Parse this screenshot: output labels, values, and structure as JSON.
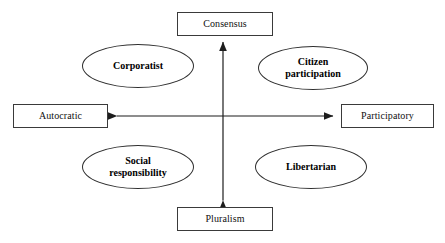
{
  "diagram": {
    "background_color": "#ffffff",
    "stroke_color": "#2f2f2f",
    "text_color": "#111111",
    "axes": {
      "vertical": {
        "top_label": "Consensus",
        "bottom_label": "Pluralism",
        "arrow_both_ends": true
      },
      "horizontal": {
        "left_label": "Autocratic",
        "right_label": "Participatory",
        "arrow_both_ends": true
      }
    },
    "boxes": [
      {
        "id": "consensus",
        "label": "Consensus",
        "position": "top"
      },
      {
        "id": "autocratic",
        "label": "Autocratic",
        "position": "left"
      },
      {
        "id": "participatory",
        "label": "Participatory",
        "position": "right"
      },
      {
        "id": "pluralism",
        "label": "Pluralism",
        "position": "bottom"
      }
    ],
    "quadrants": [
      {
        "id": "corporatist",
        "label": "Corporatist",
        "label_line1": "Corporatist",
        "label_line2": "",
        "position": "top-left"
      },
      {
        "id": "citizen-participation",
        "label": "Citizen participation",
        "label_line1": "Citizen",
        "label_line2": "participation",
        "position": "top-right"
      },
      {
        "id": "social-responsibility",
        "label": "Social responsibility",
        "label_line1": "Social",
        "label_line2": "responsibility",
        "position": "bottom-left"
      },
      {
        "id": "libertarian",
        "label": "Libertarian",
        "label_line1": "Libertarian",
        "label_line2": "",
        "position": "bottom-right"
      }
    ]
  }
}
